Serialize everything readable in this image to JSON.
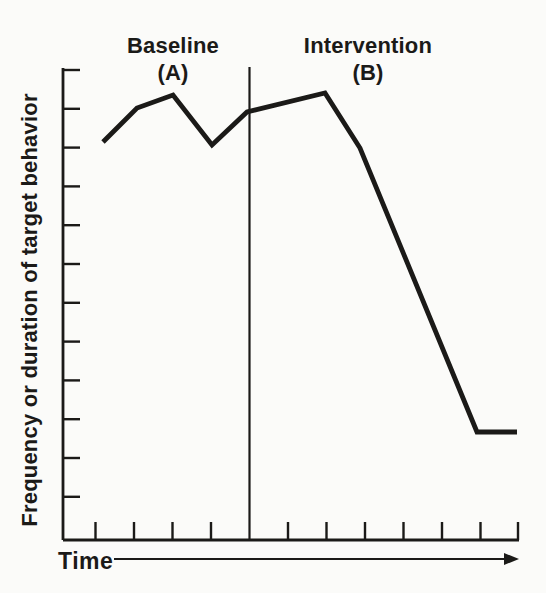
{
  "colors": {
    "ink": "#1b1a18",
    "paper": "#fbfbf9"
  },
  "chart_data": {
    "type": "line",
    "title": "",
    "xlabel": "Time",
    "ylabel": "Frequency or duration of target behavior",
    "phases": [
      {
        "label": "Baseline",
        "letter": "(A)",
        "sessions": [
          1,
          2,
          3,
          4
        ],
        "values_pct": [
          84,
          92,
          94,
          84
        ]
      },
      {
        "label": "Intervention",
        "letter": "(B)",
        "sessions": [
          5,
          7,
          8,
          11,
          12
        ],
        "values_pct": [
          91,
          95,
          83,
          23,
          23
        ]
      }
    ],
    "ylim": [
      0,
      100
    ],
    "xlim": [
      0,
      12
    ],
    "axis_numbers_shown": false,
    "grid": false,
    "legend": false,
    "y_tick_count": 12,
    "x_tick_count": 11,
    "geometry_px": {
      "y_axis": {
        "x": 63,
        "top": 68,
        "bottom": 540
      },
      "x_axis": {
        "y": 540,
        "left": 63,
        "right": 519
      },
      "y_ticks": {
        "first_y": 70,
        "step": 38.8,
        "count": 12,
        "length": 17
      },
      "x_ticks": {
        "xs": [
          95.5,
          134,
          172.5,
          211,
          288,
          326.5,
          365,
          403.5,
          442,
          480.5,
          518
        ],
        "length": 18
      },
      "divider": {
        "x": 249.5,
        "top": 67
      },
      "line_points": [
        [
          103,
          142
        ],
        [
          137,
          108
        ],
        [
          173,
          95
        ],
        [
          212,
          145
        ],
        [
          247,
          112
        ],
        [
          325,
          93
        ],
        [
          360,
          148
        ],
        [
          477,
          432
        ],
        [
          517,
          432
        ]
      ],
      "arrow": {
        "y": 559,
        "x1": 114,
        "x2": 519,
        "head_len": 15,
        "head_half": 6
      },
      "strokes": {
        "axis": 2.8,
        "tick": 2.4,
        "divider": 2.2,
        "data": 4.8,
        "arrow": 2.2
      }
    }
  }
}
